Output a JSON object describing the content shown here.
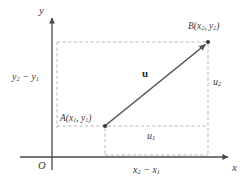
{
  "figure": {
    "background": "#ffffff",
    "axis_color": "#4a4a4a",
    "dash_color": "#b9b9b9",
    "vector_color": "#555555",
    "text_color": "#3a3a3a",
    "width": 247,
    "height": 190
  },
  "axes": {
    "x_label": "x",
    "y_label": "y",
    "origin_label": "O",
    "origin_px": {
      "x": 52,
      "y": 157
    },
    "x_axis": {
      "x1": 20,
      "y1": 157,
      "x2": 232,
      "y2": 157
    },
    "y_axis": {
      "x1": 52,
      "y1": 170,
      "x2": 52,
      "y2": 14
    }
  },
  "points": [
    {
      "id": "A",
      "label": "A(x",
      "label_sub1": "1",
      "label_mid": ", y",
      "label_sub2": "1",
      "label_end": ")",
      "px": {
        "x": 105,
        "y": 126
      }
    },
    {
      "id": "B",
      "label": "B(x",
      "label_sub1": "2",
      "label_mid": ", y",
      "label_sub2": "2",
      "label_end": ")",
      "px": {
        "x": 208,
        "y": 42
      }
    }
  ],
  "vector": {
    "name": "u",
    "from": "A",
    "to": "B",
    "label": "u"
  },
  "segments": {
    "horizontal_component": {
      "label": "u",
      "sub": "1"
    },
    "vertical_component": {
      "label": "u",
      "sub": "2"
    },
    "delta_x": {
      "pre": "x",
      "sub1": "2",
      "op": " − ",
      "post": "x",
      "sub2": "1"
    },
    "delta_y": {
      "pre": "y",
      "sub1": "2",
      "op": " − ",
      "post": "y",
      "sub2": "1"
    }
  }
}
